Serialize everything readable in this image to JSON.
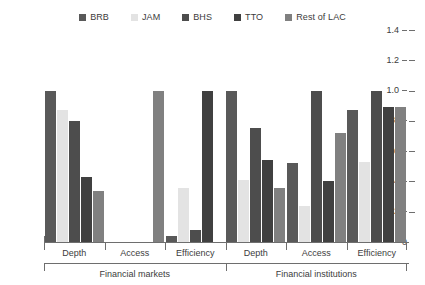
{
  "chart_data": {
    "type": "bar",
    "title": "",
    "subtitle": "",
    "xlabel": "",
    "ylabel": "",
    "ylim": [
      0,
      1.4
    ],
    "yticks": [
      "0",
      "0.2",
      "0.4",
      "0.6",
      "0.8",
      "1.0",
      "1.2",
      "1.4"
    ],
    "ytick_values": [
      0,
      0.2,
      0.4,
      0.6,
      0.8,
      1.0,
      1.2,
      1.4
    ],
    "grid": false,
    "legend_position": "top-center",
    "categories": [
      "Depth",
      "Access",
      "Efficiency",
      "Depth",
      "Access",
      "Efficiency"
    ],
    "supergroups": [
      {
        "label": "Financial markets",
        "span": 3
      },
      {
        "label": "Financial institutions",
        "span": 3
      }
    ],
    "series": [
      {
        "name": "BRB",
        "color": "#595959",
        "values": [
          1.0,
          0.0,
          0.04,
          1.0,
          0.52,
          0.87
        ]
      },
      {
        "name": "JAM",
        "color": "#e3e3e3",
        "values": [
          0.87,
          0.0,
          0.36,
          0.41,
          0.24,
          0.53
        ]
      },
      {
        "name": "BHS",
        "color": "#4d4d4d",
        "values": [
          0.8,
          0.0,
          0.08,
          0.75,
          1.0,
          1.0
        ]
      },
      {
        "name": "TTO",
        "color": "#404040",
        "values": [
          0.43,
          0.0,
          1.0,
          0.54,
          0.4,
          0.89
        ]
      },
      {
        "name": "Rest of LAC",
        "color": "#808080",
        "values": [
          0.34,
          1.0,
          0.0,
          0.36,
          0.72,
          0.89
        ]
      }
    ]
  },
  "legend": {
    "items": [
      {
        "label": "BRB",
        "color": "#595959"
      },
      {
        "label": "JAM",
        "color": "#e3e3e3"
      },
      {
        "label": "BHS",
        "color": "#4d4d4d"
      },
      {
        "label": "TTO",
        "color": "#404040"
      },
      {
        "label": "Rest of LAC",
        "color": "#808080"
      }
    ]
  },
  "colors": {
    "axis": "#6e6e6e",
    "text": "#3c3c3c",
    "background": "#ffffff"
  }
}
